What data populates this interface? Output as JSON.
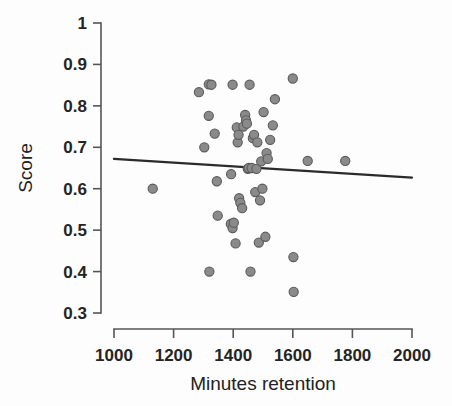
{
  "chart_data": {
    "type": "scatter",
    "title": "",
    "xlabel": "Minutes retention",
    "ylabel": "Score",
    "xlim": [
      1000,
      2000
    ],
    "ylim": [
      0.3,
      1.0
    ],
    "xticks": [
      1000,
      1200,
      1400,
      1600,
      1800,
      2000
    ],
    "xticklabels": [
      "1000",
      "1200",
      "1400",
      "1600",
      "1800",
      "2000"
    ],
    "yticks": [
      0.3,
      0.4,
      0.5,
      0.6,
      0.7,
      0.8,
      0.9,
      1.0
    ],
    "yticklabels": [
      "0.3",
      "0.4",
      "0.5",
      "0.6",
      "0.7",
      "0.8",
      "0.9",
      "1"
    ],
    "grid": false,
    "legend": false,
    "marker_color": "#8a8a8a",
    "marker_edge_color": "#5a5a5a",
    "marker_size": 8,
    "series": [
      {
        "name": "Score vs Minutes retention",
        "points": [
          [
            1130,
            0.6
          ],
          [
            1285,
            0.833
          ],
          [
            1318,
            0.852
          ],
          [
            1327,
            0.851
          ],
          [
            1318,
            0.776
          ],
          [
            1320,
            0.4
          ],
          [
            1338,
            0.733
          ],
          [
            1345,
            0.618
          ],
          [
            1348,
            0.535
          ],
          [
            1303,
            0.7
          ],
          [
            1398,
            0.851
          ],
          [
            1393,
            0.635
          ],
          [
            1392,
            0.515
          ],
          [
            1398,
            0.505
          ],
          [
            1402,
            0.518
          ],
          [
            1408,
            0.468
          ],
          [
            1412,
            0.748
          ],
          [
            1415,
            0.712
          ],
          [
            1418,
            0.73
          ],
          [
            1420,
            0.577
          ],
          [
            1424,
            0.566
          ],
          [
            1430,
            0.553
          ],
          [
            1434,
            0.75
          ],
          [
            1440,
            0.778
          ],
          [
            1443,
            0.765
          ],
          [
            1446,
            0.757
          ],
          [
            1449,
            0.648
          ],
          [
            1452,
            0.65
          ],
          [
            1455,
            0.851
          ],
          [
            1458,
            0.4
          ],
          [
            1462,
            0.65
          ],
          [
            1466,
            0.722
          ],
          [
            1470,
            0.73
          ],
          [
            1474,
            0.592
          ],
          [
            1478,
            0.648
          ],
          [
            1481,
            0.712
          ],
          [
            1486,
            0.47
          ],
          [
            1490,
            0.572
          ],
          [
            1494,
            0.666
          ],
          [
            1498,
            0.6
          ],
          [
            1502,
            0.785
          ],
          [
            1508,
            0.484
          ],
          [
            1512,
            0.686
          ],
          [
            1516,
            0.672
          ],
          [
            1524,
            0.718
          ],
          [
            1533,
            0.753
          ],
          [
            1540,
            0.816
          ],
          [
            1600,
            0.866
          ],
          [
            1602,
            0.435
          ],
          [
            1603,
            0.351
          ],
          [
            1650,
            0.667
          ],
          [
            1776,
            0.667
          ]
        ]
      }
    ],
    "trendline": {
      "name": "linear fit",
      "x": [
        1000,
        2000
      ],
      "y": [
        0.672,
        0.627
      ],
      "color": "#2b2b2b"
    }
  },
  "axes": {
    "y_axis_name": "score-axis",
    "x_axis_name": "minutes-retention-axis"
  }
}
